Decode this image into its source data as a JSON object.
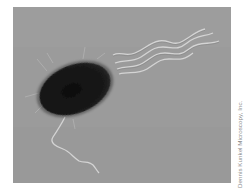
{
  "figure": {
    "colors": {
      "background": "#9b9b9b",
      "cell_body": "#151515",
      "flagella": "#d2d2d2",
      "page": "#ffffff"
    }
  },
  "credit": {
    "text": "Dennis Kunkel Microscopy, Inc."
  }
}
